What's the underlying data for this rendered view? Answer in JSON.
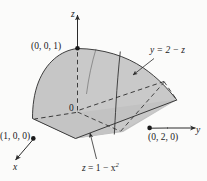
{
  "figure": {
    "kind": "3d-solid-diagram",
    "background_color": "#fbfbfa",
    "surface_fill_light": "#cfcfcf",
    "surface_fill_mid": "#c4c4c4",
    "surface_fill_dark": "#bdbdbd",
    "line_color": "#2b2b2b",
    "axes": {
      "z_label": "z",
      "y_label": "y",
      "x_label": "x"
    },
    "origin_label": "0",
    "points": [
      {
        "id": "z-intercept",
        "label": "(0, 0, 1)"
      },
      {
        "id": "x-intercept",
        "label": "(1, 0, 0)"
      },
      {
        "id": "y-intercept",
        "label": "(0, 2, 0)"
      }
    ],
    "equations": [
      {
        "id": "plane",
        "label_lhs": "y",
        "label_eq": "=",
        "label_rhs": "2 − z",
        "full": "y = 2 − z"
      },
      {
        "id": "parabolic-cylinder",
        "label_lhs": "z",
        "label_eq": "=",
        "label_rhs_base": "1 − x",
        "label_rhs_exp": "2",
        "full": "z = 1 − x²"
      }
    ]
  }
}
